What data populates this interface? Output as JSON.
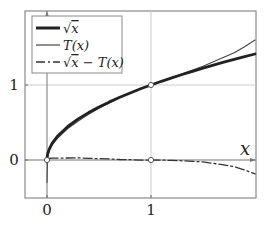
{
  "chart_data": {
    "type": "line",
    "title": "",
    "xlabel": "x",
    "ylabel": "",
    "xlim": [
      -0.21,
      2.01
    ],
    "ylim": [
      -0.51,
      1.99
    ],
    "grid": true,
    "gridlines": {
      "x": [
        1
      ],
      "y": [
        1
      ]
    },
    "xticks": [
      0,
      1
    ],
    "xtick_labels": [
      "0",
      "1"
    ],
    "yticks": [
      0,
      1
    ],
    "ytick_labels": [
      "0",
      "1"
    ],
    "legend_position": "upper left",
    "markers": [
      {
        "x": 0,
        "y": 0,
        "style": "open-circle"
      },
      {
        "x": 1,
        "y": 1,
        "style": "open-circle"
      },
      {
        "x": 1,
        "y": 0,
        "style": "open-circle"
      }
    ],
    "series": [
      {
        "name": "√x",
        "style": "thick-solid",
        "color": "#222222",
        "x": [
          0,
          0.005,
          0.02,
          0.05,
          0.1,
          0.2,
          0.3,
          0.4,
          0.5,
          0.6,
          0.7,
          0.8,
          0.9,
          1.0,
          1.1,
          1.2,
          1.3,
          1.4,
          1.5,
          1.6,
          1.7,
          1.8,
          1.9,
          2.0
        ],
        "values": [
          0,
          0.071,
          0.141,
          0.224,
          0.316,
          0.447,
          0.548,
          0.632,
          0.707,
          0.775,
          0.837,
          0.894,
          0.949,
          1.0,
          1.049,
          1.095,
          1.14,
          1.183,
          1.225,
          1.265,
          1.304,
          1.342,
          1.378,
          1.414
        ]
      },
      {
        "name": "T(x)",
        "style": "thin-solid",
        "color": "#444444",
        "x": [
          0,
          0.005,
          0.02,
          0.05,
          0.1,
          0.2,
          0.3,
          0.4,
          0.5,
          0.6,
          0.7,
          0.8,
          0.9,
          1.0,
          1.1,
          1.2,
          1.3,
          1.4,
          1.5,
          1.6,
          1.7,
          1.8,
          1.9,
          2.0
        ],
        "values": [
          -0.3,
          0.04,
          0.12,
          0.2,
          0.29,
          0.42,
          0.52,
          0.61,
          0.69,
          0.76,
          0.83,
          0.89,
          0.95,
          1.0,
          1.05,
          1.1,
          1.15,
          1.2,
          1.25,
          1.31,
          1.37,
          1.43,
          1.51,
          1.6
        ]
      },
      {
        "name": "√x − T(x)",
        "style": "dash-dot",
        "color": "#333333",
        "x": [
          0.02,
          0.05,
          0.1,
          0.2,
          0.3,
          0.4,
          0.5,
          0.6,
          0.7,
          0.8,
          0.9,
          1.0,
          1.1,
          1.2,
          1.3,
          1.4,
          1.5,
          1.6,
          1.7,
          1.8,
          1.9,
          2.0
        ],
        "values": [
          0.02,
          0.024,
          0.026,
          0.027,
          0.028,
          0.022,
          0.017,
          0.015,
          0.007,
          0.004,
          -0.001,
          0.0,
          -0.001,
          -0.005,
          -0.01,
          -0.017,
          -0.025,
          -0.045,
          -0.066,
          -0.088,
          -0.132,
          -0.186
        ]
      }
    ]
  },
  "legend": {
    "items": [
      {
        "label_prefix": "√",
        "label_var": "x",
        "label_suffix": ""
      },
      {
        "label_prefix": "",
        "label_var": "T",
        "label_suffix": "(x)"
      },
      {
        "label_prefix": "√",
        "label_var": "x",
        "label_suffix": " − T(x)"
      }
    ]
  },
  "axes": {
    "x_axis_label": "x",
    "x_tick_0": "0",
    "x_tick_1": "1",
    "y_tick_0": "0",
    "y_tick_1": "1"
  },
  "colors": {
    "frame": "#888888",
    "grid": "#cccccc",
    "axis": "#777777",
    "ink": "#222222"
  }
}
